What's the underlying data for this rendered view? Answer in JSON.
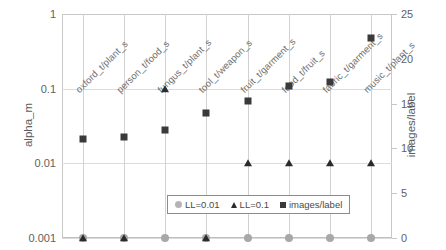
{
  "chart_data": {
    "type": "scatter",
    "title": "",
    "categories": [
      "oxford_t/plant_s",
      "person_t/food_s",
      "fungus_t/plant_s",
      "tool_t/weapon_s",
      "fruit_t/garment_s",
      "food_t/fruit_s",
      "fabric_t/garment_s",
      "music_t/plant_s"
    ],
    "xlabel": "",
    "ylabel": "alpha_m",
    "y2label": "images/label",
    "yscale": "log",
    "ylim": [
      0.001,
      1
    ],
    "y2lim": [
      0,
      25
    ],
    "yticks": [
      "1",
      "0.1",
      "0.01",
      "0.001"
    ],
    "ytick_values": [
      1,
      0.1,
      0.01,
      0.001
    ],
    "y2ticks": [
      "25",
      "20",
      "15",
      "10",
      "5",
      "0"
    ],
    "y2tick_values": [
      25,
      20,
      15,
      10,
      5,
      0
    ],
    "grid": true,
    "legend_position": "bottom-center",
    "series": [
      {
        "name": "LL=0.01",
        "marker": "circle",
        "color": "#a8a8a8",
        "axis": "left",
        "values": [
          0.001,
          0.001,
          0.001,
          0.001,
          0.001,
          0.001,
          0.001,
          0.001
        ]
      },
      {
        "name": "LL=0.1",
        "marker": "triangle",
        "color": "#2b2b2b",
        "axis": "left",
        "values": [
          0.001,
          0.001,
          0.1,
          0.001,
          0.01,
          0.01,
          0.01,
          0.01
        ]
      },
      {
        "name": "images/label",
        "marker": "square",
        "color": "#3a3a3a",
        "axis": "right",
        "values": [
          11.0,
          11.3,
          12.0,
          14.0,
          15.3,
          17.0,
          17.4,
          22.3
        ]
      }
    ]
  },
  "legend": {
    "entries": [
      {
        "label": "LL=0.01",
        "marker": "circle"
      },
      {
        "label": "LL=0.1",
        "marker": "triangle"
      },
      {
        "label": "images/label",
        "marker": "square"
      }
    ]
  }
}
